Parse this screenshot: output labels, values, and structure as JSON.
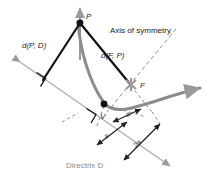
{
  "figure": {
    "type": "geometry-diagram",
    "background_color": "#ffffff"
  },
  "colors": {
    "curve": "#8c8c8c",
    "directrix": "#b0b0b0",
    "segment": "#111111",
    "dashed": "#8c8c8c",
    "text_dark": "#1a1a1a",
    "text_grey": "#8a8a8a",
    "focus_marker": "#9a9a9a",
    "point_fill": "#111111"
  },
  "labels": {
    "point_p": "P",
    "point_f": "F",
    "point_v": "V",
    "distance_p_to_directrix": "d(P, D)",
    "distance_f_to_p": "d(F, P)",
    "axis_of_symmetry": "Axis of symmetry",
    "directrix": "Directrix D",
    "directrix_name": "Directrix",
    "directrix_symbol": "D",
    "measure_a_upper": "a",
    "measure_a_lower": "a",
    "measure_2a": "2a"
  },
  "geometry": {
    "point_p": {
      "x": 80,
      "y": 23
    },
    "point_f": {
      "x": 131,
      "y": 84
    },
    "point_v": {
      "x": 104,
      "y": 104
    },
    "directrix_start": {
      "x": 14,
      "y": 58
    },
    "directrix_end": {
      "x": 175,
      "y": 169
    },
    "foot_of_perpendicular": {
      "x": 42,
      "y": 80
    },
    "axis_arrow_tip": {
      "x": 80,
      "y": 5
    },
    "curve_right_tip": {
      "x": 203,
      "y": 88
    }
  },
  "measurements": [
    {
      "label": "a",
      "from": "V",
      "to": "F",
      "value": "a"
    },
    {
      "label": "a",
      "from": "directrix",
      "to": "V",
      "value": "a"
    },
    {
      "label": "2a",
      "from": "directrix",
      "to": "F",
      "value": "2a"
    }
  ],
  "annotations": {
    "right_angle_left": "right-angle at foot of perpendicular from P",
    "right_angle_vertex": "right-angle at vertex V perpendicular to directrix"
  }
}
